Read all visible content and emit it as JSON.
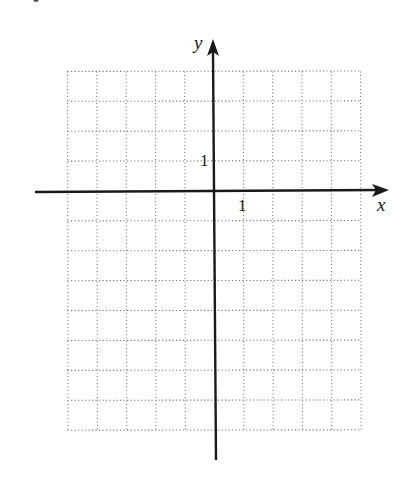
{
  "diagram": {
    "type": "coordinate-grid",
    "axes": {
      "x_label": "x",
      "y_label": "y"
    },
    "tick_labels": {
      "x_unit": "1",
      "y_unit": "1"
    },
    "grid": {
      "x_min": -5,
      "x_max": 5,
      "y_min": -8,
      "y_max": 4,
      "step": 1,
      "line_style": "dotted"
    },
    "colors": {
      "axis": "#1a1a1a",
      "grid": "#777777",
      "background": "#ffffff"
    }
  },
  "chart_data": {
    "type": "scatter",
    "title": "",
    "xlabel": "x",
    "ylabel": "y",
    "xlim": [
      -5,
      5
    ],
    "ylim": [
      -8,
      4
    ],
    "grid": true,
    "x_ticks_labeled": [
      1
    ],
    "y_ticks_labeled": [
      1
    ],
    "series": []
  }
}
